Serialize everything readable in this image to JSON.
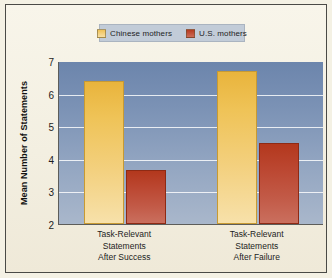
{
  "figure": {
    "background_color": "#f4f1e4",
    "frame_color": "#4a4a46"
  },
  "legend": {
    "position": "top-center",
    "background_color": "#c2ccd8",
    "entries": [
      {
        "label": "Chinese mothers",
        "color": "#eab63f",
        "swatch_name": "legend-swatch-chinese-mothers"
      },
      {
        "label": "U.S. mothers",
        "color": "#b3381d",
        "swatch_name": "legend-swatch-us-mothers"
      }
    ]
  },
  "axes": {
    "ylabel": "Mean Number of Statements",
    "y_ticks": [
      "7",
      "6",
      "5",
      "4",
      "3",
      "2"
    ],
    "ylim": [
      2,
      7
    ],
    "plot_background_top": "#6c85ac",
    "plot_background_bottom": "#a9b7cb",
    "gridline_color": "#ffffff"
  },
  "chart_data": {
    "type": "bar",
    "title": "",
    "xlabel": "",
    "ylabel": "Mean Number of Statements",
    "ylim": [
      2,
      7
    ],
    "yticks": [
      2,
      3,
      4,
      5,
      6,
      7
    ],
    "grid": true,
    "legend_position": "top-center",
    "categories": [
      "Task-Relevant Statements After Success",
      "Task-Relevant Statements After Failure"
    ],
    "category_lines": [
      [
        "Task-Relevant",
        "Statements",
        "After Success"
      ],
      [
        "Task-Relevant",
        "Statements",
        "After Failure"
      ]
    ],
    "series": [
      {
        "name": "Chinese mothers",
        "color": "#eab63f",
        "values": [
          6.4,
          6.7
        ]
      },
      {
        "name": "U.S. mothers",
        "color": "#b3381d",
        "values": [
          3.65,
          4.5
        ]
      }
    ]
  }
}
